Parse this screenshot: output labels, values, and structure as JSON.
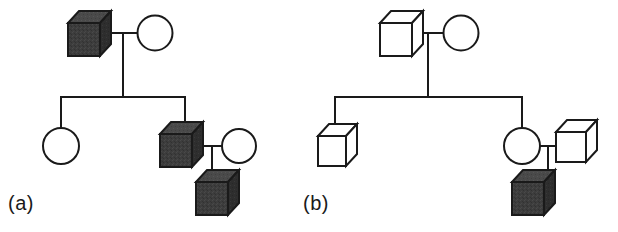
{
  "figure": {
    "type": "pedigree-chart",
    "width": 618,
    "height": 232,
    "background_color": "#ffffff",
    "stroke_color": "#1a1a1a",
    "affected_fill_color": "#3d3d3d",
    "unaffected_fill_color": "#ffffff"
  },
  "labels": {
    "panel_a": "(a)",
    "panel_b": "(b)"
  },
  "legend_semantics": {
    "cube_shape": "male individual, drawn as 3D cube",
    "circle_shape": "female individual, drawn as circle",
    "filled_dark": "affected individual",
    "unfilled_white": "unaffected individual"
  },
  "panels": [
    {
      "id": "a",
      "label": "(a)",
      "individuals": [
        {
          "id": "a-I-1",
          "shape": "cube",
          "sex": "male",
          "affected": true,
          "generation": 1,
          "x": 68,
          "y": 11
        },
        {
          "id": "a-I-2",
          "shape": "circle",
          "sex": "female",
          "affected": false,
          "generation": 1,
          "x": 138,
          "y": 12
        },
        {
          "id": "a-II-1",
          "shape": "circle",
          "sex": "female",
          "affected": false,
          "generation": 2,
          "x": 40,
          "y": 128
        },
        {
          "id": "a-II-2",
          "shape": "cube",
          "sex": "male",
          "affected": true,
          "generation": 2,
          "x": 160,
          "y": 122
        },
        {
          "id": "a-II-3",
          "shape": "circle",
          "sex": "female",
          "affected": false,
          "generation": 2,
          "x": 222,
          "y": 124
        },
        {
          "id": "a-III-1",
          "shape": "cube",
          "sex": "male",
          "affected": true,
          "generation": 3,
          "x": 196,
          "y": 170
        }
      ],
      "matings": [
        {
          "partners": [
            "a-I-1",
            "a-I-2"
          ],
          "children": [
            "a-II-1",
            "a-II-2"
          ]
        },
        {
          "partners": [
            "a-II-2",
            "a-II-3"
          ],
          "children": [
            "a-III-1"
          ]
        }
      ]
    },
    {
      "id": "b",
      "label": "(b)",
      "individuals": [
        {
          "id": "b-I-1",
          "shape": "cube",
          "sex": "male",
          "affected": false,
          "generation": 1,
          "x": 380,
          "y": 11
        },
        {
          "id": "b-I-2",
          "shape": "circle",
          "sex": "female",
          "affected": false,
          "generation": 1,
          "x": 444,
          "y": 12
        },
        {
          "id": "b-II-1",
          "shape": "cube",
          "sex": "male",
          "affected": false,
          "generation": 2,
          "x": 318,
          "y": 124
        },
        {
          "id": "b-II-2",
          "shape": "circle",
          "sex": "female",
          "affected": false,
          "generation": 2,
          "x": 504,
          "y": 124
        },
        {
          "id": "b-II-3",
          "shape": "cube",
          "sex": "male",
          "affected": false,
          "generation": 2,
          "x": 556,
          "y": 120
        },
        {
          "id": "b-III-1",
          "shape": "cube",
          "sex": "male",
          "affected": true,
          "generation": 3,
          "x": 512,
          "y": 170
        }
      ],
      "matings": [
        {
          "partners": [
            "b-I-1",
            "b-I-2"
          ],
          "children": [
            "b-II-1",
            "b-II-2"
          ]
        },
        {
          "partners": [
            "b-II-2",
            "b-II-3"
          ],
          "children": [
            "b-III-1"
          ]
        }
      ]
    }
  ]
}
